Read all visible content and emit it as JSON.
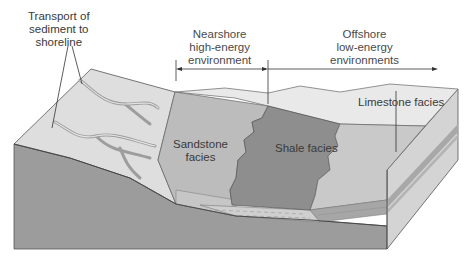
{
  "diagram": {
    "type": "geologic block diagram",
    "labels": {
      "transport": [
        "Transport of",
        "sediment to",
        "shoreline"
      ],
      "nearshore": [
        "Nearshore",
        "high-energy",
        "environment"
      ],
      "offshore": [
        "Offshore",
        "low-energy",
        "environments"
      ],
      "sandstone": [
        "Sandstone",
        "facies"
      ],
      "shale": "Shale facies",
      "limestone": "Limestone facies"
    },
    "colors": {
      "background": "#ffffff",
      "land_surface": "#dcdcdc",
      "sea_surface": "#e6e6e6",
      "sandstone": "#b9b9b9",
      "shale": "#8f8f8f",
      "limestone": "#c8c8c8",
      "basement": "#9a9a9a",
      "side_face": "#d2d2d2",
      "river": "#a8a8a8",
      "text": "#3a3a3a",
      "line": "#333333"
    }
  }
}
